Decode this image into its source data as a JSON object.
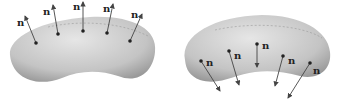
{
  "figure": {
    "left": {
      "caption": "outward normals",
      "normal_label": "n",
      "points": [
        {
          "px": 36,
          "py": 43,
          "tx": 25,
          "ty": 16,
          "lx": 17,
          "ly": 26
        },
        {
          "px": 58,
          "py": 34,
          "tx": 53,
          "ty": 5,
          "lx": 43,
          "ly": 15
        },
        {
          "px": 83,
          "py": 31,
          "tx": 83,
          "ty": 2,
          "lx": 73,
          "ly": 10
        },
        {
          "px": 107,
          "py": 33,
          "tx": 113,
          "ty": 4,
          "lx": 103,
          "ly": 12
        },
        {
          "px": 130,
          "py": 41,
          "tx": 142,
          "ty": 14,
          "lx": 131,
          "ly": 18
        }
      ]
    },
    "right": {
      "caption": "inward normals",
      "normal_label": "n",
      "points": [
        {
          "px": 201,
          "py": 61,
          "tx": 220,
          "ty": 91,
          "lx": 206,
          "ly": 66
        },
        {
          "px": 229,
          "py": 51,
          "tx": 239,
          "ty": 85,
          "lx": 234,
          "ly": 59
        },
        {
          "px": 257,
          "py": 44,
          "tx": 257,
          "ty": 67,
          "lx": 262,
          "ly": 49
        },
        {
          "px": 283,
          "py": 56,
          "tx": 275,
          "ty": 86,
          "lx": 288,
          "ly": 64
        },
        {
          "px": 310,
          "py": 63,
          "tx": 288,
          "ty": 98,
          "lx": 313,
          "ly": 74
        }
      ]
    },
    "colors": {
      "surface_light": "#e4e4e4",
      "surface_dark": "#a8a8a8",
      "arrow": "#444444",
      "point": "#222222"
    }
  }
}
